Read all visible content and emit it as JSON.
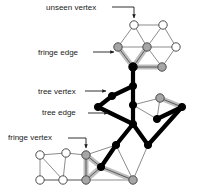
{
  "figure": {
    "background": "#ffffff"
  },
  "colors": {
    "tree": "#000000",
    "fringe_vertex_fill": "#a6a6a6",
    "fringe_edge_halo": "#bdbdbd",
    "unseen_vertex_fill": "#ffffff",
    "unseen_edge": "#8c8c8c",
    "outline": "#4d4d4d",
    "label_text": "#1a1a1a",
    "leader_line": "#1a1a1a"
  },
  "labels": {
    "unseen_vertex": "unseen vertex",
    "fringe_edge": "fringe edge",
    "tree_vertex": "tree vertex",
    "tree_edge": "tree edge",
    "fringe_vertex": "fringe vertex"
  },
  "legend_targets": {
    "unseen_vertex": {
      "x": 134,
      "y": 25
    },
    "fringe_edge": {
      "x": 120,
      "y": 52
    },
    "tree_vertex": {
      "x": 108,
      "y": 91
    },
    "tree_edge": {
      "x": 110,
      "y": 113
    },
    "fringe_vertex": {
      "x": 86,
      "y": 153
    }
  },
  "graph": {
    "vertices": [
      {
        "id": "u1",
        "x": 134,
        "y": 25,
        "state": "unseen"
      },
      {
        "id": "u2",
        "x": 163,
        "y": 25,
        "state": "unseen"
      },
      {
        "id": "f1",
        "x": 118,
        "y": 47,
        "state": "fringe"
      },
      {
        "id": "f2",
        "x": 147,
        "y": 47,
        "state": "fringe"
      },
      {
        "id": "u3",
        "x": 176,
        "y": 47,
        "state": "unseen"
      },
      {
        "id": "t1",
        "x": 133,
        "y": 67,
        "state": "tree"
      },
      {
        "id": "f3",
        "x": 162,
        "y": 67,
        "state": "fringe"
      },
      {
        "id": "t2",
        "x": 133,
        "y": 86,
        "state": "tree"
      },
      {
        "id": "t3",
        "x": 112,
        "y": 96,
        "state": "tree"
      },
      {
        "id": "t4",
        "x": 133,
        "y": 105,
        "state": "tree"
      },
      {
        "id": "t5",
        "x": 98,
        "y": 107,
        "state": "tree"
      },
      {
        "id": "f4",
        "x": 160,
        "y": 98,
        "state": "fringe"
      },
      {
        "id": "t6",
        "x": 182,
        "y": 107,
        "state": "tree"
      },
      {
        "id": "t7",
        "x": 157,
        "y": 119,
        "state": "tree"
      },
      {
        "id": "t8",
        "x": 133,
        "y": 124,
        "state": "tree"
      },
      {
        "id": "t9",
        "x": 116,
        "y": 145,
        "state": "tree"
      },
      {
        "id": "t10",
        "x": 148,
        "y": 145,
        "state": "tree"
      },
      {
        "id": "t11",
        "x": 101,
        "y": 167,
        "state": "tree"
      },
      {
        "id": "fv",
        "x": 86,
        "y": 155,
        "state": "fringe"
      },
      {
        "id": "f5",
        "x": 86,
        "y": 180,
        "state": "fringe"
      },
      {
        "id": "f6",
        "x": 133,
        "y": 180,
        "state": "fringe"
      },
      {
        "id": "u4",
        "x": 40,
        "y": 155,
        "state": "unseen"
      },
      {
        "id": "u5",
        "x": 66,
        "y": 153,
        "state": "unseen"
      },
      {
        "id": "u6",
        "x": 40,
        "y": 180,
        "state": "unseen"
      },
      {
        "id": "u7",
        "x": 63,
        "y": 180,
        "state": "unseen"
      }
    ],
    "edges": [
      {
        "from": "u1",
        "to": "u2",
        "type": "unseen"
      },
      {
        "from": "u1",
        "to": "f1",
        "type": "unseen"
      },
      {
        "from": "u1",
        "to": "f2",
        "type": "unseen"
      },
      {
        "from": "u2",
        "to": "f2",
        "type": "unseen"
      },
      {
        "from": "u2",
        "to": "u3",
        "type": "unseen"
      },
      {
        "from": "f1",
        "to": "f2",
        "type": "unseen"
      },
      {
        "from": "f2",
        "to": "u3",
        "type": "unseen"
      },
      {
        "from": "u3",
        "to": "f3",
        "type": "unseen"
      },
      {
        "from": "f2",
        "to": "f3",
        "type": "unseen"
      },
      {
        "from": "f1",
        "to": "t1",
        "type": "fringe"
      },
      {
        "from": "f2",
        "to": "t1",
        "type": "fringe"
      },
      {
        "from": "t1",
        "to": "f3",
        "type": "fringe"
      },
      {
        "from": "t1",
        "to": "t2",
        "type": "tree"
      },
      {
        "from": "t2",
        "to": "t3",
        "type": "tree"
      },
      {
        "from": "t2",
        "to": "t4",
        "type": "tree"
      },
      {
        "from": "t3",
        "to": "t5",
        "type": "tree"
      },
      {
        "from": "t4",
        "to": "f4",
        "type": "unseen"
      },
      {
        "from": "t4",
        "to": "t7",
        "type": "unseen"
      },
      {
        "from": "f4",
        "to": "t7",
        "type": "unseen"
      },
      {
        "from": "f4",
        "to": "t6",
        "type": "fringe"
      },
      {
        "from": "t6",
        "to": "t7",
        "type": "tree"
      },
      {
        "from": "t6",
        "to": "t10",
        "type": "tree"
      },
      {
        "from": "t4",
        "to": "t8",
        "type": "tree"
      },
      {
        "from": "t5",
        "to": "t8",
        "type": "tree"
      },
      {
        "from": "t8",
        "to": "t9",
        "type": "tree"
      },
      {
        "from": "t8",
        "to": "t10",
        "type": "tree"
      },
      {
        "from": "t9",
        "to": "t11",
        "type": "tree"
      },
      {
        "from": "t9",
        "to": "fv",
        "type": "unseen"
      },
      {
        "from": "t9",
        "to": "f6",
        "type": "unseen"
      },
      {
        "from": "t10",
        "to": "f6",
        "type": "unseen"
      },
      {
        "from": "fv",
        "to": "t11",
        "type": "fringe"
      },
      {
        "from": "fv",
        "to": "f5",
        "type": "fringe"
      },
      {
        "from": "f5",
        "to": "t11",
        "type": "fringe"
      },
      {
        "from": "t11",
        "to": "f6",
        "type": "fringe"
      },
      {
        "from": "f5",
        "to": "f6",
        "type": "unseen"
      },
      {
        "from": "fv",
        "to": "u5",
        "type": "unseen"
      },
      {
        "from": "u5",
        "to": "u4",
        "type": "unseen"
      },
      {
        "from": "u4",
        "to": "u6",
        "type": "unseen"
      },
      {
        "from": "u4",
        "to": "u7",
        "type": "unseen"
      },
      {
        "from": "u5",
        "to": "u7",
        "type": "unseen"
      },
      {
        "from": "u6",
        "to": "u7",
        "type": "unseen"
      },
      {
        "from": "u6",
        "to": "f5",
        "type": "unseen"
      },
      {
        "from": "fv",
        "to": "f5",
        "type": "unseen"
      }
    ]
  }
}
